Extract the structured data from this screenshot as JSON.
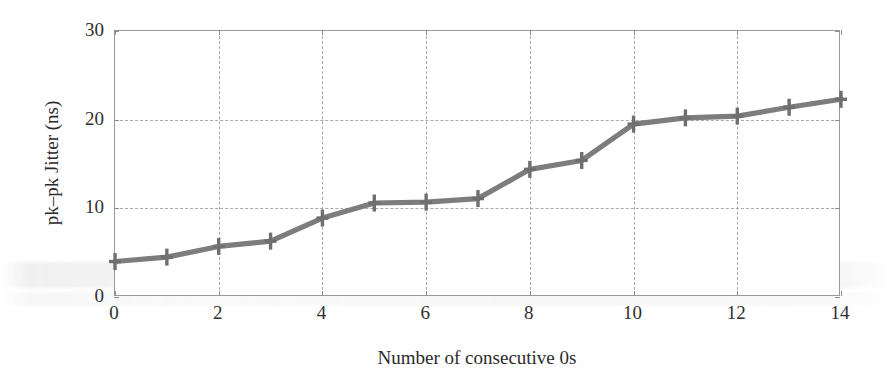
{
  "chart_data": {
    "type": "line",
    "title": "",
    "xlabel": "Number of consecutive 0s",
    "ylabel": "pk–pk Jitter (ns)",
    "x": [
      0,
      1,
      2,
      3,
      4,
      5,
      6,
      7,
      8,
      9,
      10,
      11,
      12,
      13,
      14
    ],
    "values": [
      4.0,
      4.5,
      5.7,
      6.3,
      8.9,
      10.6,
      10.7,
      11.1,
      14.4,
      15.4,
      19.5,
      20.2,
      20.4,
      21.4,
      22.3
    ],
    "series": [
      {
        "name": "pk-pk jitter",
        "values": [
          4.0,
          4.5,
          5.7,
          6.3,
          8.9,
          10.6,
          10.7,
          11.1,
          14.4,
          15.4,
          19.5,
          20.2,
          20.4,
          21.4,
          22.3
        ]
      }
    ],
    "xlim": [
      0,
      14
    ],
    "ylim": [
      0,
      30
    ],
    "xticks": [
      0,
      2,
      4,
      6,
      8,
      10,
      12,
      14
    ],
    "xtick_labels": [
      "0",
      "2",
      "4",
      "6",
      "8",
      "10",
      "12",
      "14"
    ],
    "yticks": [
      0,
      10,
      20,
      30
    ],
    "ytick_labels": [
      "0",
      "10",
      "20",
      "30"
    ],
    "grid": true,
    "grid_style": "dashed",
    "legend": false,
    "legend_position": "none",
    "marker": "plus",
    "line_color": "#7d7d7d",
    "marker_color": "#6f6f6f",
    "grid_color": "#a9a9a9",
    "frame_color": "#9a9a9a",
    "text_color": "#2b2b2b",
    "background_color": "#ffffff"
  }
}
